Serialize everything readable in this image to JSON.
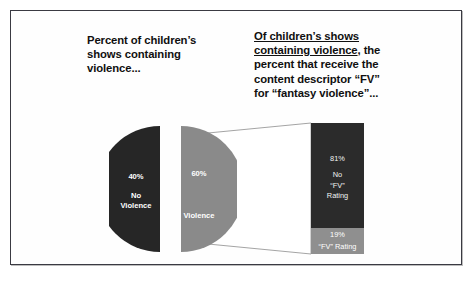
{
  "slide": {
    "heading_left": {
      "line1": "Percent of children’s",
      "line2": "shows containing",
      "line3": "violence..."
    },
    "heading_right": {
      "underlined_1": "Of children’s shows",
      "underlined_2": "containing violence",
      "rest_1": ", the",
      "line3": "percent that receive the",
      "line4": "content  descriptor “FV”",
      "line5": "for “fantasy violence”..."
    }
  },
  "chart_data": [
    {
      "type": "pie",
      "title": "Percent of children’s shows containing violence...",
      "exploded": true,
      "labels": [
        "No Violence",
        "Violence"
      ],
      "values": [
        40,
        60
      ],
      "value_labels": [
        "40%",
        "60%"
      ],
      "colors": [
        "#262626",
        "#8a8a8a"
      ],
      "slices": [
        {
          "label": "No Violence",
          "label_line1": "No",
          "label_line2": "Violence",
          "percent_label": "40%",
          "value": 40,
          "color": "#262626"
        },
        {
          "label": "Violence",
          "label_line1": "Violence",
          "label_line2": "",
          "percent_label": "60%",
          "value": 60,
          "color": "#8a8a8a"
        }
      ]
    },
    {
      "type": "bar",
      "title": "Of children’s shows containing violence, the percent that receive the content descriptor “FV” for “fantasy violence”...",
      "orientation": "vertical-stacked",
      "categories": [
        "No “FV” Rating",
        "“FV” Rating"
      ],
      "values": [
        81,
        19
      ],
      "value_labels": [
        "81%",
        "19%"
      ],
      "colors": [
        "#2b2b2b",
        "#8f8f8f"
      ],
      "segments": [
        {
          "percent_label": "81%",
          "value": 81,
          "line1": "No",
          "line2": "“FV”",
          "line3": "Rating",
          "color": "#2b2b2b"
        },
        {
          "percent_label": "19%",
          "value": 19,
          "line1": "“FV” Rating",
          "line2": "",
          "line3": "",
          "color": "#8f8f8f"
        }
      ]
    }
  ],
  "colors": {
    "dark": "#262626",
    "gray": "#8a8a8a",
    "border": "#3a3a42",
    "background": "#fefefe",
    "text": "#101010"
  }
}
